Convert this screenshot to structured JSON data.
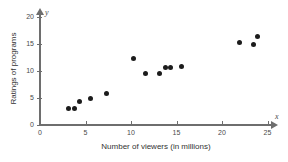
{
  "chart_data": {
    "type": "scatter",
    "title": "",
    "xlabel": "Number of viewers (in millions)",
    "ylabel": "Ratings of programs",
    "x_axis_symbol": "x",
    "y_axis_symbol": "y",
    "xlim": [
      0,
      26
    ],
    "ylim": [
      0,
      21
    ],
    "xticks": [
      0,
      5,
      10,
      15,
      20,
      25
    ],
    "yticks": [
      0,
      5,
      10,
      15,
      20
    ],
    "xticklabels": [
      "0",
      "5",
      "10",
      "15",
      "20",
      "25"
    ],
    "yticklabels": [
      "0",
      "5",
      "10",
      "15",
      "20"
    ],
    "grid": false,
    "legend": false,
    "marker_color": "#1c1c1c",
    "axis_color": "#6e6e6e",
    "points": [
      {
        "x": 3.1,
        "y": 3.1
      },
      {
        "x": 3.8,
        "y": 3.1
      },
      {
        "x": 4.3,
        "y": 4.4
      },
      {
        "x": 5.5,
        "y": 5.0
      },
      {
        "x": 7.3,
        "y": 5.9
      },
      {
        "x": 10.3,
        "y": 12.4
      },
      {
        "x": 11.6,
        "y": 9.6
      },
      {
        "x": 13.1,
        "y": 9.6
      },
      {
        "x": 13.8,
        "y": 10.6
      },
      {
        "x": 14.3,
        "y": 10.6
      },
      {
        "x": 15.5,
        "y": 10.9
      },
      {
        "x": 21.9,
        "y": 15.2
      },
      {
        "x": 23.5,
        "y": 15.0
      },
      {
        "x": 23.9,
        "y": 16.3
      }
    ]
  }
}
